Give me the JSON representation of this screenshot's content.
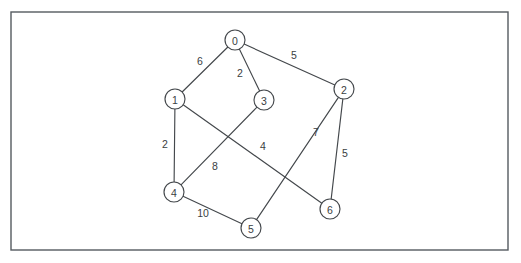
{
  "figure": {
    "type": "undirected-weighted-graph",
    "background_color": "#ffffff",
    "stroke_color": "#44484c",
    "frame_color": "#555b60",
    "node_fill": "#ffffff",
    "node_radius": 10
  },
  "frame": {
    "x": 11,
    "y": 12,
    "width": 497,
    "height": 238
  },
  "chart_data": {
    "type": "diagram",
    "title": "",
    "nodes": [
      {
        "id": "n0",
        "label": "0",
        "x": 235,
        "y": 40
      },
      {
        "id": "n1",
        "label": "1",
        "x": 175,
        "y": 99
      },
      {
        "id": "n2",
        "label": "2",
        "x": 344,
        "y": 89
      },
      {
        "id": "n3",
        "label": "3",
        "x": 264,
        "y": 100
      },
      {
        "id": "n4",
        "label": "4",
        "x": 174,
        "y": 192
      },
      {
        "id": "n5",
        "label": "5",
        "x": 251,
        "y": 228
      },
      {
        "id": "n6",
        "label": "6",
        "x": 330,
        "y": 209
      }
    ],
    "edges": [
      {
        "id": "e0-1",
        "source": "n0",
        "target": "n1",
        "weight": "6",
        "label_x": 200,
        "label_y": 61
      },
      {
        "id": "e0-3",
        "source": "n0",
        "target": "n3",
        "weight": "2",
        "label_x": 240,
        "label_y": 73
      },
      {
        "id": "e0-2",
        "source": "n0",
        "target": "n2",
        "weight": "5",
        "label_x": 294,
        "label_y": 55
      },
      {
        "id": "e1-4",
        "source": "n1",
        "target": "n4",
        "weight": "2",
        "label_x": 165,
        "label_y": 144
      },
      {
        "id": "e1-6",
        "source": "n1",
        "target": "n6",
        "weight": "4",
        "label_x": 263,
        "label_y": 146
      },
      {
        "id": "e4-3",
        "source": "n4",
        "target": "n3",
        "weight": "8",
        "label_x": 215,
        "label_y": 166
      },
      {
        "id": "e4-5",
        "source": "n4",
        "target": "n5",
        "weight": "10",
        "label_x": 203,
        "label_y": 213
      },
      {
        "id": "e2-5",
        "source": "n2",
        "target": "n5",
        "weight": "7",
        "label_x": 316,
        "label_y": 132
      },
      {
        "id": "e2-6",
        "source": "n2",
        "target": "n6",
        "weight": "5",
        "label_x": 345,
        "label_y": 153
      }
    ]
  }
}
